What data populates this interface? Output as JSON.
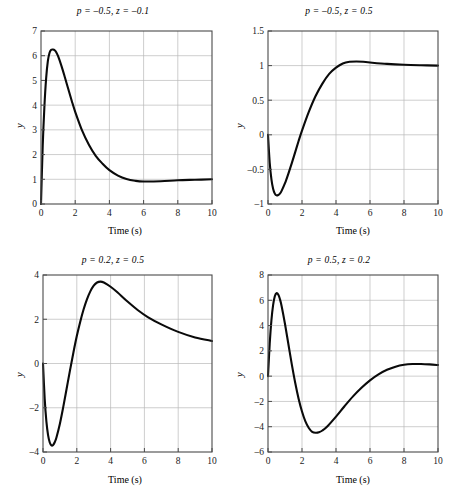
{
  "figure": {
    "panels": [
      {
        "name": "panel-top-left",
        "title": "p = –0.5, z = –0.1",
        "xlabel": "Time (s)",
        "ylabel": "y",
        "xticks": [
          "0",
          "2",
          "4",
          "6",
          "8",
          "10"
        ],
        "yticks": [
          "0",
          "1",
          "2",
          "3",
          "4",
          "5",
          "6",
          "7"
        ]
      },
      {
        "name": "panel-top-right",
        "title": "p = –0.5, z = 0.5",
        "xlabel": "Time (s)",
        "ylabel": "y",
        "xticks": [
          "0",
          "2",
          "4",
          "6",
          "8",
          "10"
        ],
        "yticks": [
          "–1",
          "–0.5",
          "0",
          "0.5",
          "1",
          "1.5"
        ]
      },
      {
        "name": "panel-bottom-left",
        "title": "p = 0.2, z = 0.5",
        "xlabel": "Time (s)",
        "ylabel": "y",
        "xticks": [
          "0",
          "2",
          "4",
          "6",
          "8",
          "10"
        ],
        "yticks": [
          "–4",
          "–2",
          "0",
          "2",
          "4"
        ]
      },
      {
        "name": "panel-bottom-right",
        "title": "p = 0.5, z = 0.2",
        "xlabel": "Time (s)",
        "ylabel": "y",
        "xticks": [
          "0",
          "2",
          "4",
          "6",
          "8",
          "10"
        ],
        "yticks": [
          "–6",
          "–4",
          "–2",
          "0",
          "2",
          "4",
          "6",
          "8"
        ]
      }
    ]
  },
  "chart_data": [
    {
      "type": "line",
      "title": "p = –0.5, z = –0.1",
      "xlabel": "Time (s)",
      "ylabel": "y",
      "xlim": [
        0,
        10
      ],
      "ylim": [
        0,
        7
      ],
      "xticks": [
        0,
        2,
        4,
        6,
        8,
        10
      ],
      "yticks": [
        0,
        1,
        2,
        3,
        4,
        5,
        6,
        7
      ],
      "grid": true,
      "legend": null,
      "parameters": {
        "p": -0.5,
        "z": -0.1
      },
      "series": [
        {
          "name": "step response",
          "color": "#0a0a0a",
          "x": [
            0,
            0.1,
            0.2,
            0.3,
            0.4,
            0.5,
            0.6,
            0.7,
            0.8,
            0.9,
            1.0,
            1.2,
            1.4,
            1.6,
            1.8,
            2.0,
            2.4,
            2.8,
            3.2,
            3.6,
            4.0,
            4.5,
            5.0,
            5.5,
            6.0,
            7.0,
            8.0,
            9.0,
            10.0
          ],
          "y": [
            0,
            2.35,
            3.95,
            5.08,
            5.78,
            6.12,
            6.24,
            6.25,
            6.22,
            6.13,
            5.98,
            5.58,
            5.12,
            4.64,
            4.17,
            3.73,
            2.98,
            2.4,
            1.95,
            1.63,
            1.37,
            1.15,
            1.01,
            0.94,
            0.91,
            0.92,
            0.96,
            0.98,
            1.0
          ]
        }
      ]
    },
    {
      "type": "line",
      "title": "p = –0.5, z = 0.5",
      "xlabel": "Time (s)",
      "ylabel": "y",
      "xlim": [
        0,
        10
      ],
      "ylim": [
        -1,
        1.5
      ],
      "xticks": [
        0,
        2,
        4,
        6,
        8,
        10
      ],
      "yticks": [
        -1,
        -0.5,
        0,
        0.5,
        1,
        1.5
      ],
      "grid": true,
      "legend": null,
      "parameters": {
        "p": -0.5,
        "z": 0.5
      },
      "series": [
        {
          "name": "step response",
          "color": "#0a0a0a",
          "x": [
            0,
            0.1,
            0.2,
            0.3,
            0.4,
            0.5,
            0.6,
            0.7,
            0.8,
            1.0,
            1.2,
            1.4,
            1.6,
            1.8,
            2.0,
            2.4,
            2.8,
            3.2,
            3.6,
            4.0,
            4.4,
            4.8,
            5.2,
            5.6,
            6.0,
            7.0,
            8.0,
            9.0,
            10.0
          ],
          "y": [
            0,
            -0.4,
            -0.64,
            -0.78,
            -0.85,
            -0.875,
            -0.87,
            -0.85,
            -0.81,
            -0.7,
            -0.56,
            -0.41,
            -0.25,
            -0.09,
            0.06,
            0.33,
            0.56,
            0.74,
            0.88,
            0.97,
            1.03,
            1.055,
            1.06,
            1.055,
            1.045,
            1.025,
            1.012,
            1.005,
            1.0
          ]
        }
      ]
    },
    {
      "type": "line",
      "title": "p = 0.2, z = 0.5",
      "xlabel": "Time (s)",
      "ylabel": "y",
      "xlim": [
        0,
        10
      ],
      "ylim": [
        -4,
        4
      ],
      "xticks": [
        0,
        2,
        4,
        6,
        8,
        10
      ],
      "yticks": [
        -4,
        -2,
        0,
        2,
        4
      ],
      "grid": true,
      "legend": null,
      "parameters": {
        "p": 0.2,
        "z": 0.5
      },
      "series": [
        {
          "name": "step response",
          "color": "#0a0a0a",
          "x": [
            0,
            0.1,
            0.2,
            0.3,
            0.4,
            0.5,
            0.6,
            0.7,
            0.8,
            1.0,
            1.2,
            1.4,
            1.6,
            1.8,
            2.0,
            2.2,
            2.4,
            2.6,
            2.8,
            3.0,
            3.2,
            3.4,
            3.6,
            4.0,
            4.4,
            5.0,
            5.6,
            6.2,
            7.0,
            8.0,
            9.0,
            10.0
          ],
          "y": [
            0,
            -1.6,
            -2.62,
            -3.24,
            -3.57,
            -3.7,
            -3.68,
            -3.55,
            -3.33,
            -2.72,
            -1.96,
            -1.13,
            -0.3,
            0.5,
            1.24,
            1.88,
            2.44,
            2.9,
            3.26,
            3.52,
            3.66,
            3.7,
            3.66,
            3.47,
            3.22,
            2.8,
            2.42,
            2.1,
            1.77,
            1.43,
            1.18,
            1.02
          ]
        }
      ]
    },
    {
      "type": "line",
      "title": "p = 0.5, z = 0.2",
      "xlabel": "Time (s)",
      "ylabel": "y",
      "xlim": [
        0,
        10
      ],
      "ylim": [
        -6,
        8
      ],
      "xticks": [
        0,
        2,
        4,
        6,
        8,
        10
      ],
      "yticks": [
        -6,
        -4,
        -2,
        0,
        2,
        4,
        6,
        8
      ],
      "grid": true,
      "legend": null,
      "parameters": {
        "p": 0.5,
        "z": 0.2
      },
      "series": [
        {
          "name": "step response",
          "color": "#0a0a0a",
          "x": [
            0,
            0.1,
            0.2,
            0.3,
            0.4,
            0.5,
            0.6,
            0.7,
            0.8,
            1.0,
            1.2,
            1.4,
            1.6,
            1.8,
            2.0,
            2.2,
            2.4,
            2.6,
            2.8,
            3.0,
            3.2,
            3.5,
            4.0,
            4.5,
            5.0,
            5.5,
            6.0,
            6.5,
            7.0,
            7.5,
            8.0,
            8.5,
            9.0,
            9.5,
            10.0
          ],
          "y": [
            0,
            2.55,
            4.4,
            5.62,
            6.32,
            6.56,
            6.46,
            6.1,
            5.55,
            4.12,
            2.52,
            0.93,
            -0.52,
            -1.78,
            -2.8,
            -3.58,
            -4.1,
            -4.4,
            -4.48,
            -4.44,
            -4.3,
            -3.96,
            -3.2,
            -2.38,
            -1.6,
            -0.92,
            -0.33,
            0.14,
            0.5,
            0.75,
            0.9,
            0.96,
            0.96,
            0.93,
            0.88
          ]
        }
      ]
    }
  ]
}
